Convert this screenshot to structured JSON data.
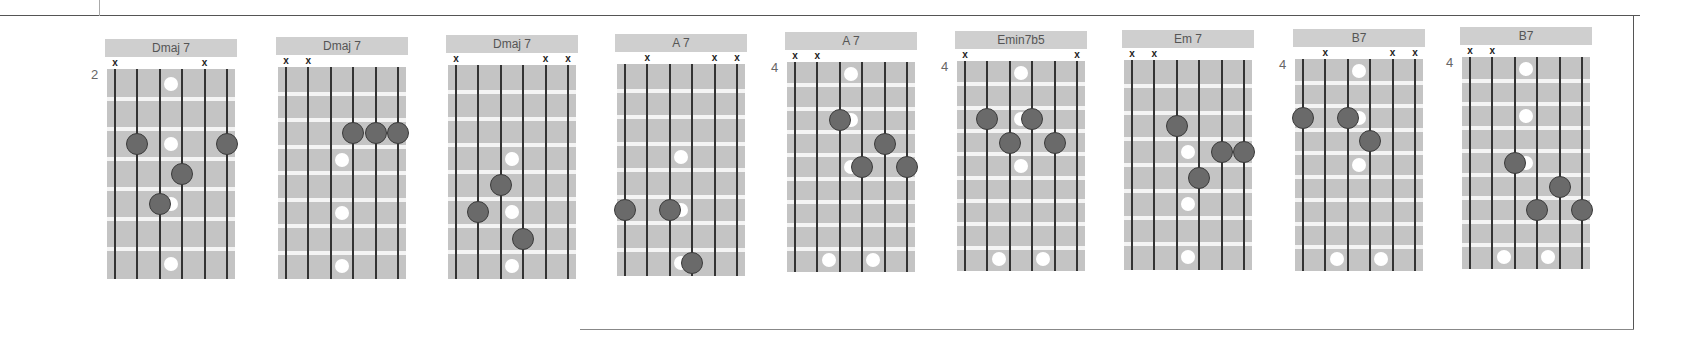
{
  "page": {
    "type": "guitar chord diagrams"
  },
  "diagrams": [
    {
      "name": "Dmaj 7",
      "fret_number": "2",
      "muted_strings": [
        1,
        5
      ],
      "dots": [
        [
          2,
          3
        ],
        [
          4,
          4
        ],
        [
          3,
          5
        ],
        [
          6,
          3
        ]
      ],
      "markers": [
        [
          3.5,
          1
        ],
        [
          3.5,
          3
        ],
        [
          3.5,
          5
        ],
        [
          3.5,
          7
        ]
      ]
    },
    {
      "name": "Dmaj 7",
      "fret_number": "",
      "muted_strings": [
        1,
        2
      ],
      "dots": [
        [
          4,
          3
        ],
        [
          5,
          3
        ],
        [
          6,
          3
        ]
      ],
      "markers": [
        [
          3.5,
          4
        ],
        [
          3.5,
          6
        ],
        [
          3.5,
          8
        ]
      ]
    },
    {
      "name": "Dmaj 7",
      "fret_number": "",
      "muted_strings": [
        1,
        5,
        6
      ],
      "dots": [
        [
          3,
          5
        ],
        [
          2,
          6
        ],
        [
          4,
          7
        ]
      ],
      "markers": [
        [
          3.5,
          4
        ],
        [
          3.5,
          6
        ],
        [
          3.5,
          8
        ]
      ]
    },
    {
      "name": "A 7",
      "fret_number": "",
      "muted_strings": [
        2,
        5,
        6
      ],
      "dots": [
        [
          1,
          6
        ],
        [
          3,
          6
        ],
        [
          4,
          8
        ]
      ],
      "markers": [
        [
          3.5,
          4
        ],
        [
          3.5,
          6
        ],
        [
          3.5,
          8
        ]
      ]
    },
    {
      "name": "A 7",
      "fret_number": "4",
      "muted_strings": [
        1,
        2
      ],
      "dots": [
        [
          3,
          3
        ],
        [
          5,
          4
        ],
        [
          4,
          5
        ],
        [
          6,
          5
        ]
      ],
      "markers": [
        [
          3.5,
          1
        ],
        [
          3.5,
          3
        ],
        [
          3.5,
          5
        ],
        [
          2.5,
          9
        ],
        [
          4.5,
          9
        ]
      ]
    },
    {
      "name": "Emin7b5",
      "fret_number": "4",
      "muted_strings": [
        1,
        6
      ],
      "dots": [
        [
          2,
          3
        ],
        [
          3,
          4
        ],
        [
          4,
          3
        ],
        [
          5,
          4
        ]
      ],
      "markers": [
        [
          3.5,
          1
        ],
        [
          3.5,
          3
        ],
        [
          3.5,
          5
        ],
        [
          2.5,
          9
        ],
        [
          4.5,
          9
        ]
      ]
    },
    {
      "name": "Em 7",
      "fret_number": "",
      "muted_strings": [
        1,
        2
      ],
      "dots": [
        [
          3,
          3
        ],
        [
          5,
          4
        ],
        [
          6,
          4
        ],
        [
          4,
          5
        ]
      ],
      "markers": [
        [
          3.5,
          4
        ],
        [
          3.5,
          6
        ],
        [
          3.5,
          8
        ]
      ]
    },
    {
      "name": "B7",
      "fret_number": "4",
      "muted_strings": [
        2,
        5,
        6
      ],
      "dots": [
        [
          1,
          3
        ],
        [
          3,
          3
        ],
        [
          4,
          4
        ]
      ],
      "markers": [
        [
          3.5,
          1
        ],
        [
          3.5,
          3
        ],
        [
          3.5,
          5
        ],
        [
          2.5,
          9
        ],
        [
          4.5,
          9
        ]
      ]
    },
    {
      "name": "B7",
      "fret_number": "4",
      "muted_strings": [
        1,
        2
      ],
      "dots": [
        [
          3,
          5
        ],
        [
          5,
          6
        ],
        [
          4,
          7
        ],
        [
          6,
          7
        ]
      ],
      "markers": [
        [
          3.5,
          1
        ],
        [
          3.5,
          3
        ],
        [
          3.5,
          5
        ],
        [
          2.5,
          9
        ],
        [
          4.5,
          9
        ]
      ]
    }
  ],
  "colors": {
    "title_bg": "#cfcfcf",
    "board_bg": "#c4c4c4",
    "fret_line": "#f4f4f4",
    "string": "#333333",
    "dot": "#6a6a6a",
    "marker": "#ffffff"
  }
}
